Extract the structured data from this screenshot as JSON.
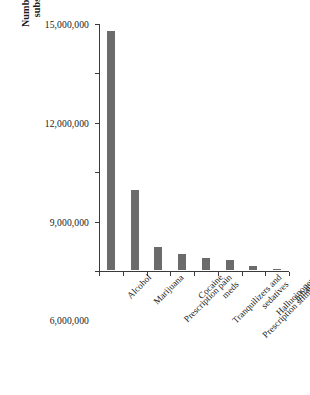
{
  "chart_data": {
    "type": "bar",
    "title": "",
    "subtitle": "",
    "xlabel": "",
    "ylabel": "Number of Americans with substance use disorder",
    "ylabel_lines": [
      "Number of Americans with",
      "substance use disorder"
    ],
    "categories": [
      "Alcohol",
      "Marijuana",
      "Prescription pain meds",
      "Cocaine",
      "Tranquilizers and sedatives",
      "Prescription stimulants",
      "Hallucinogens",
      "Inhalants"
    ],
    "category_lines": [
      [
        "Alcohol"
      ],
      [
        "Marijuana"
      ],
      [
        "Prescription pain",
        "meds"
      ],
      [
        "Cocaine"
      ],
      [
        "Tranquilizers and",
        "sedatives"
      ],
      [
        "Prescription stimulants"
      ],
      [
        "Hallucinogens"
      ],
      [
        "Inhalants"
      ]
    ],
    "values": [
      14500000,
      4850000,
      1400000,
      1000000,
      700000,
      600000,
      250000,
      60000
    ],
    "ylim": [
      0,
      15000000
    ],
    "ytick_values": [
      0,
      3000000,
      6000000,
      9000000,
      12000000,
      15000000
    ],
    "ytick_labels": [
      "0",
      "3,000,000",
      "6,000,000",
      "9,000,000",
      "12,000,000",
      "15,000,000"
    ],
    "grid": false,
    "legend": false,
    "bar_color": "#6b6b6b",
    "axis_color": "#3a3a3a",
    "background_color": "#ffffff"
  }
}
